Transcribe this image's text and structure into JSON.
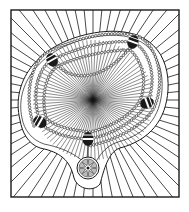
{
  "illustration": {
    "subject": "beaded necklace with star pendant over radiating lines",
    "colors": {
      "background": "#ffffff",
      "ink": "#1a1a1a",
      "bead_fill": "#f4f4f4"
    },
    "frame": {
      "x": 11,
      "y": 10,
      "width": 168,
      "height": 187
    },
    "outer_center": {
      "x": 93,
      "y": 100
    },
    "inner_center": {
      "x": 93,
      "y": 100
    },
    "pendant": {
      "x": 88,
      "y": 168,
      "r": 11
    },
    "dark_beads": [
      {
        "x": 52,
        "y": 60,
        "angle": -30
      },
      {
        "x": 133,
        "y": 42,
        "angle": 20
      },
      {
        "x": 147,
        "y": 103,
        "angle": 70
      },
      {
        "x": 40,
        "y": 122,
        "angle": -60
      },
      {
        "x": 88,
        "y": 139,
        "angle": 0
      }
    ]
  }
}
